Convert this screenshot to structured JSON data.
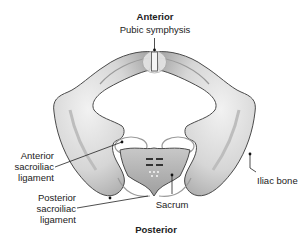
{
  "diagram": {
    "orientation": {
      "top": "Anterior",
      "bottom": "Posterior"
    },
    "labels": {
      "pubic_symphysis": "Pubic symphysis",
      "anterior_sacroiliac_ligament": [
        "Anterior",
        "sacroiliac",
        "ligament"
      ],
      "posterior_sacroiliac_ligament": [
        "Posterior",
        "sacroiliac",
        "ligament"
      ],
      "sacrum": "Sacrum",
      "iliac_bone": "Iliac bone"
    },
    "colors": {
      "bone_fill": "#dcdcdc",
      "bone_outline": "#4a4a4a",
      "sacrum_fill": "#b8b8b8",
      "ligament": "#9a9a9a",
      "leader_line": "#222222"
    }
  }
}
